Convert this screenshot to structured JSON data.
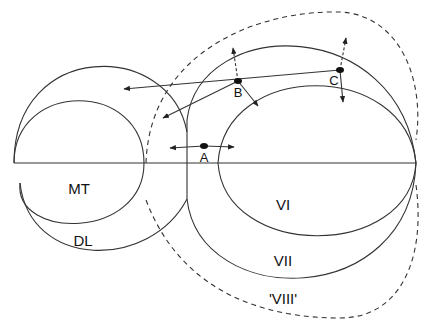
{
  "diagram": {
    "regions": [
      {
        "id": "MT",
        "label": "MT",
        "x": 79,
        "y": 188
      },
      {
        "id": "DL",
        "label": "DL",
        "x": 83,
        "y": 240
      },
      {
        "id": "VI",
        "label": "VI",
        "x": 283,
        "y": 204
      },
      {
        "id": "VII",
        "label": "VII",
        "x": 283,
        "y": 260
      },
      {
        "id": "VIII",
        "label": "'VIII'",
        "x": 283,
        "y": 298
      }
    ],
    "points": [
      {
        "id": "A",
        "label": "A",
        "x": 204,
        "y": 146,
        "label_x": 204,
        "label_y": 157
      },
      {
        "id": "B",
        "label": "B",
        "x": 238,
        "y": 81,
        "label_x": 238,
        "label_y": 92
      },
      {
        "id": "C",
        "label": "C",
        "x": 340,
        "y": 70,
        "label_x": 334,
        "label_y": 80
      }
    ],
    "colors": {
      "line": "#333333",
      "point": "#111111"
    }
  }
}
